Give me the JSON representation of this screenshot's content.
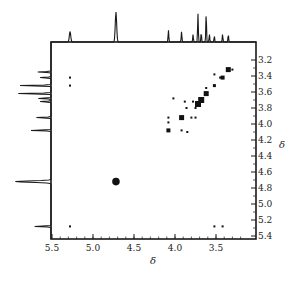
{
  "figure": {
    "x_axis_title": "δ",
    "y_axis_title": "δ",
    "x_ticks": [
      "5.5",
      "5.0",
      "4.5",
      "4.0",
      "3.5"
    ],
    "y_ticks": [
      "3.2",
      "3.4",
      "3.6",
      "3.8",
      "4.0",
      "4.2",
      "4.4",
      "4.6",
      "4.8",
      "5.0",
      "5.2",
      "5.4"
    ]
  },
  "chart_data": {
    "type": "heatmap",
    "title": "",
    "subtitle": "2D homonuclear correlation spectrum (COSY-type) with 1D projections on top and left",
    "xlabel": "δ",
    "ylabel": "δ",
    "xlim": [
      5.5,
      3.2
    ],
    "ylim": [
      3.1,
      5.5
    ],
    "x_ticks": [
      5.5,
      5.0,
      4.5,
      4.0,
      3.5
    ],
    "y_ticks": [
      3.2,
      3.4,
      3.6,
      3.8,
      4.0,
      4.2,
      4.4,
      4.6,
      4.8,
      5.0,
      5.2,
      5.4
    ],
    "grid": false,
    "legend": null,
    "top_projection_peaks": [
      {
        "ppm": 5.28,
        "height": 0.35
      },
      {
        "ppm": 4.72,
        "height": 1.0
      },
      {
        "ppm": 4.08,
        "height": 0.4
      },
      {
        "ppm": 3.92,
        "height": 0.35
      },
      {
        "ppm": 3.78,
        "height": 0.25
      },
      {
        "ppm": 3.72,
        "height": 0.95
      },
      {
        "ppm": 3.68,
        "height": 0.3
      },
      {
        "ppm": 3.62,
        "height": 0.95
      },
      {
        "ppm": 3.58,
        "height": 0.25
      },
      {
        "ppm": 3.52,
        "height": 0.2
      },
      {
        "ppm": 3.42,
        "height": 0.25
      },
      {
        "ppm": 3.35,
        "height": 0.25
      }
    ],
    "left_projection_peaks": [
      {
        "ppm": 3.35,
        "height": 0.35
      },
      {
        "ppm": 3.42,
        "height": 0.3
      },
      {
        "ppm": 3.52,
        "height": 0.85
      },
      {
        "ppm": 3.62,
        "height": 0.9
      },
      {
        "ppm": 3.68,
        "height": 0.35
      },
      {
        "ppm": 3.72,
        "height": 0.3
      },
      {
        "ppm": 3.92,
        "height": 0.4
      },
      {
        "ppm": 4.08,
        "height": 0.55
      },
      {
        "ppm": 4.72,
        "height": 0.95
      },
      {
        "ppm": 5.28,
        "height": 0.45
      }
    ],
    "cross_peaks": [
      {
        "x": 3.35,
        "y": 3.32,
        "size": 5
      },
      {
        "x": 3.42,
        "y": 3.42,
        "size": 4
      },
      {
        "x": 3.3,
        "y": 3.32,
        "size": 2
      },
      {
        "x": 3.52,
        "y": 3.52,
        "size": 3
      },
      {
        "x": 3.62,
        "y": 3.62,
        "size": 5
      },
      {
        "x": 3.68,
        "y": 3.7,
        "size": 6
      },
      {
        "x": 3.72,
        "y": 3.75,
        "size": 6
      },
      {
        "x": 3.78,
        "y": 3.72,
        "size": 2
      },
      {
        "x": 3.75,
        "y": 3.8,
        "size": 2
      },
      {
        "x": 3.92,
        "y": 3.92,
        "size": 5
      },
      {
        "x": 4.08,
        "y": 4.08,
        "size": 4
      },
      {
        "x": 3.88,
        "y": 3.72,
        "size": 2
      },
      {
        "x": 3.86,
        "y": 3.8,
        "size": 2
      },
      {
        "x": 4.08,
        "y": 3.92,
        "size": 2
      },
      {
        "x": 3.92,
        "y": 4.08,
        "size": 2
      },
      {
        "x": 4.02,
        "y": 3.68,
        "size": 2
      },
      {
        "x": 3.75,
        "y": 3.92,
        "size": 2
      },
      {
        "x": 3.8,
        "y": 3.92,
        "size": 2
      },
      {
        "x": 3.62,
        "y": 3.55,
        "size": 2
      },
      {
        "x": 3.85,
        "y": 4.1,
        "size": 2
      },
      {
        "x": 3.52,
        "y": 3.38,
        "size": 2
      },
      {
        "x": 3.45,
        "y": 3.42,
        "size": 2
      },
      {
        "x": 4.72,
        "y": 4.72,
        "size": 5
      },
      {
        "x": 5.28,
        "y": 5.28,
        "size": 2
      },
      {
        "x": 5.28,
        "y": 3.42,
        "size": 2
      },
      {
        "x": 5.28,
        "y": 3.52,
        "size": 2
      },
      {
        "x": 3.52,
        "y": 5.28,
        "size": 2
      },
      {
        "x": 3.42,
        "y": 5.28,
        "size": 2
      },
      {
        "x": 4.08,
        "y": 3.98,
        "size": 2
      }
    ]
  }
}
